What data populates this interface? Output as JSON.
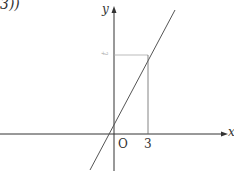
{
  "header_fragment": "3))",
  "axes": {
    "x_label": "x",
    "y_label": "y",
    "origin_label": "O"
  },
  "point": {
    "x_tick_label": "3",
    "y_tick_label": "t"
  },
  "colors": {
    "axis": "#333333",
    "line": "#555555",
    "guide": "#888888",
    "faint_label": "#bbbbbb"
  }
}
